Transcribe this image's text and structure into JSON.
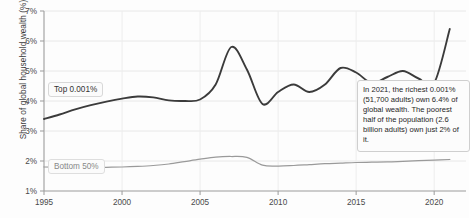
{
  "chart_data": {
    "type": "line",
    "title": "",
    "xlabel": "",
    "ylabel": "Share of global household wealth (%)",
    "xlim": [
      1995,
      2021
    ],
    "ylim": [
      1,
      7
    ],
    "grid": true,
    "legend_position": "inline-labels",
    "ytick_labels": [
      "7%",
      "6%",
      "5%",
      "4%",
      "3%",
      "2%",
      "1%"
    ],
    "ytick_values": [
      7,
      6,
      5,
      4,
      3,
      2,
      1
    ],
    "xtick_labels": [
      "1995",
      "2000",
      "2005",
      "2010",
      "2015",
      "2020"
    ],
    "xtick_values": [
      1995,
      2000,
      2005,
      2010,
      2015,
      2020
    ],
    "x": [
      1995,
      1996,
      1997,
      1998,
      1999,
      2000,
      2001,
      2002,
      2003,
      2004,
      2005,
      2006,
      2007,
      2008,
      2009,
      2010,
      2011,
      2012,
      2013,
      2014,
      2015,
      2016,
      2017,
      2018,
      2019,
      2020,
      2021
    ],
    "series": [
      {
        "name": "Top 0.001%",
        "color": "#3b3b3b",
        "width": 1.9,
        "values": [
          3.4,
          3.55,
          3.72,
          3.86,
          3.98,
          4.08,
          4.15,
          4.12,
          4.02,
          4.0,
          4.05,
          4.55,
          5.8,
          5.05,
          3.9,
          4.3,
          4.55,
          4.3,
          4.55,
          5.1,
          4.95,
          4.6,
          4.8,
          5.0,
          4.75,
          4.6,
          6.4
        ]
      },
      {
        "name": "Bottom 50%",
        "color": "#9a9a9a",
        "width": 1.25,
        "values": [
          1.8,
          1.79,
          1.78,
          1.78,
          1.79,
          1.8,
          1.82,
          1.85,
          1.9,
          1.98,
          2.06,
          2.13,
          2.15,
          2.12,
          1.86,
          1.83,
          1.85,
          1.88,
          1.91,
          1.93,
          1.95,
          1.96,
          1.97,
          1.99,
          2.01,
          2.03,
          2.05
        ]
      }
    ],
    "annotations": [
      {
        "name": "wealth-inequality-note",
        "text": "In 2021, the richest 0.001% (51,700 adults) own 6.4% of global wealth. The poorest half of the population (2.6 billion adults) own just 2% of it."
      }
    ]
  },
  "labels": {
    "series_top": "Top 0.001%",
    "series_bottom": "Bottom 50%"
  }
}
